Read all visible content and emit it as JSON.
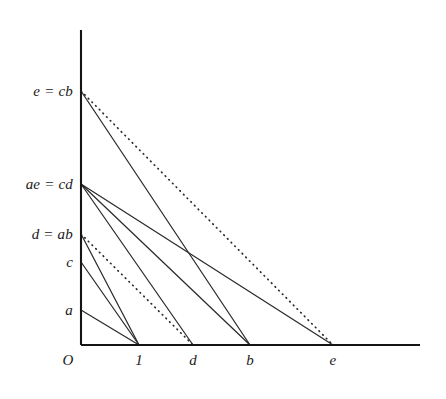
{
  "figure": {
    "type": "geometric-line-diagram",
    "background_color": "#ffffff",
    "line_color": "#2b2b2b",
    "axis_color": "#151515",
    "axes": {
      "y_axis": {
        "x": 81,
        "y_top": 30,
        "y_bottom": 345
      },
      "x_axis": {
        "y": 345,
        "x_left": 81,
        "x_right": 420
      }
    },
    "y_labels": [
      {
        "text": "e = cb",
        "value_y": 91,
        "label_x": 73
      },
      {
        "text": "ae = cd",
        "value_y": 184,
        "label_x": 73
      },
      {
        "text": "d = ab",
        "value_y": 234,
        "label_x": 73
      },
      {
        "text": "c",
        "value_y": 262,
        "label_x": 73
      },
      {
        "text": "a",
        "value_y": 310,
        "label_x": 73
      }
    ],
    "x_labels": [
      {
        "text": "O",
        "value_x": 68,
        "label_y": 352
      },
      {
        "text": "1",
        "value_x": 139,
        "label_y": 352
      },
      {
        "text": "d",
        "value_x": 193,
        "label_y": 352
      },
      {
        "text": "b",
        "value_x": 250,
        "label_y": 352
      },
      {
        "text": "e",
        "value_x": 333,
        "label_y": 352
      }
    ],
    "segments": [
      {
        "name": "cb-to-b",
        "from": "e = cb",
        "to": "b",
        "x1": 81,
        "y1": 91,
        "x2": 250,
        "y2": 345,
        "style": "solid"
      },
      {
        "name": "cb-to-e",
        "from": "e = cb",
        "to": "e",
        "x1": 81,
        "y1": 91,
        "x2": 333,
        "y2": 345,
        "style": "dotted"
      },
      {
        "name": "cd-to-d",
        "from": "ae = cd",
        "to": "d",
        "x1": 81,
        "y1": 184,
        "x2": 193,
        "y2": 345,
        "style": "solid"
      },
      {
        "name": "cd-to-b",
        "from": "ae = cd",
        "to": "b",
        "x1": 81,
        "y1": 184,
        "x2": 250,
        "y2": 345,
        "style": "solid"
      },
      {
        "name": "cd-to-e",
        "from": "ae = cd",
        "to": "e",
        "x1": 81,
        "y1": 184,
        "x2": 333,
        "y2": 345,
        "style": "solid"
      },
      {
        "name": "ab-to-1",
        "from": "d = ab",
        "to": "1",
        "x1": 81,
        "y1": 234,
        "x2": 139,
        "y2": 345,
        "style": "solid"
      },
      {
        "name": "ab-to-d",
        "from": "d = ab",
        "to": "d",
        "x1": 81,
        "y1": 234,
        "x2": 193,
        "y2": 345,
        "style": "dotted"
      },
      {
        "name": "c-to-1",
        "from": "c",
        "to": "1",
        "x1": 81,
        "y1": 262,
        "x2": 139,
        "y2": 345,
        "style": "solid"
      },
      {
        "name": "a-to-1",
        "from": "a",
        "to": "1",
        "x1": 81,
        "y1": 310,
        "x2": 139,
        "y2": 345,
        "style": "solid"
      }
    ]
  }
}
